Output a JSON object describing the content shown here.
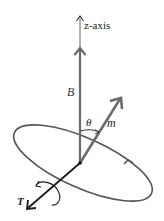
{
  "diagram": {
    "type": "physics-vector-diagram",
    "labels": {
      "z_axis": "z-axis",
      "field": "B",
      "moment": "m",
      "angle": "θ",
      "torque": "T"
    },
    "colors": {
      "field_and_moment": "#6b6b6b",
      "orbit": "#555555",
      "torque": "#1a1a1a",
      "text": "#222222"
    },
    "elements": [
      {
        "name": "z-axis",
        "kind": "arrow",
        "from": [
          80,
          163
        ],
        "to": [
          80,
          15
        ]
      },
      {
        "name": "B",
        "kind": "vector",
        "along": "z-axis"
      },
      {
        "name": "m",
        "kind": "vector",
        "from": [
          80,
          163
        ],
        "to": [
          121,
          98
        ]
      },
      {
        "name": "theta",
        "kind": "angle-arc",
        "between": [
          "B",
          "m"
        ]
      },
      {
        "name": "precession-orbit",
        "kind": "ellipse",
        "direction": "counter-clockwise arrow on right side"
      },
      {
        "name": "T",
        "kind": "vector",
        "from": [
          80,
          163
        ],
        "to": [
          27,
          209
        ],
        "with": "curl arrow"
      }
    ]
  }
}
